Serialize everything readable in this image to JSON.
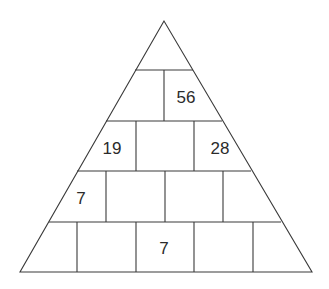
{
  "puzzle": {
    "type": "number-pyramid",
    "rows": [
      {
        "row": 1,
        "cells": [
          ""
        ]
      },
      {
        "row": 2,
        "cells": [
          "",
          "56"
        ]
      },
      {
        "row": 3,
        "cells": [
          "19",
          "",
          "28"
        ]
      },
      {
        "row": 4,
        "cells": [
          "7",
          "",
          "",
          ""
        ]
      },
      {
        "row": 5,
        "cells": [
          "",
          "",
          "7",
          "",
          ""
        ]
      }
    ],
    "given": {
      "r2c2": "56",
      "r3c1": "19",
      "r3c3": "28",
      "r4c1": "7",
      "r5c3": "7"
    }
  },
  "colors": {
    "line": "#3a3a3a",
    "text": "#2b2b2b",
    "background": "#ffffff"
  }
}
